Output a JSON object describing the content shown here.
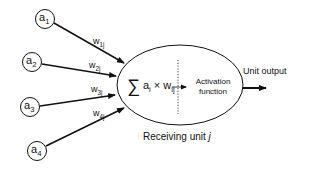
{
  "diagram": {
    "inputs": [
      {
        "id": "a1",
        "base": "a",
        "sub": "1",
        "weight_base": "w",
        "weight_sub": "1j"
      },
      {
        "id": "a2",
        "base": "a",
        "sub": "2",
        "weight_base": "w",
        "weight_sub": "2j"
      },
      {
        "id": "a3",
        "base": "a",
        "sub": "3",
        "weight_base": "w",
        "weight_sub": "3j"
      },
      {
        "id": "a4",
        "base": "a",
        "sub": "4",
        "weight_base": "w",
        "weight_sub": "4j"
      }
    ],
    "summation": {
      "symbol": "∑",
      "term_a": "a",
      "term_a_sub": "i",
      "times": "×",
      "term_w": "w",
      "term_w_sub": "ij"
    },
    "activation": {
      "line1": "Activation",
      "line2": "function"
    },
    "output_label": "Unit output",
    "receiving_unit": {
      "text": "Receiving unit ",
      "var": "j"
    },
    "colors": {
      "stroke": "#111111",
      "background": "#ffffff"
    }
  }
}
